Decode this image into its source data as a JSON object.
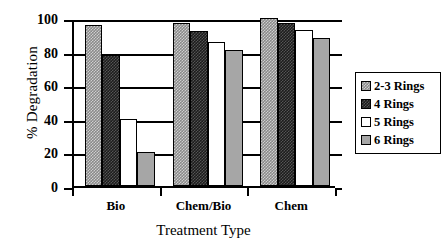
{
  "chart_data": {
    "type": "bar",
    "title": "",
    "xlabel": "Treatment Type",
    "ylabel": "% Degradation",
    "categories": [
      "Bio",
      "Chem/Bio",
      "Chem"
    ],
    "series": [
      {
        "name": "2-3 Rings",
        "values": [
          96,
          97,
          100
        ],
        "swatch": "checkered-light-gray"
      },
      {
        "name": "4 Rings",
        "values": [
          78,
          92,
          97
        ],
        "swatch": "dark-dither"
      },
      {
        "name": "5 Rings",
        "values": [
          40,
          86,
          93
        ],
        "swatch": "white"
      },
      {
        "name": "6 Rings",
        "values": [
          20,
          81,
          88
        ],
        "swatch": "medium-gray"
      }
    ],
    "ylim": [
      0,
      100
    ],
    "yticks": [
      0,
      20,
      40,
      60,
      80,
      100
    ],
    "ytick_labels": [
      "0",
      "20",
      "40",
      "60",
      "80",
      "100"
    ],
    "grid": true,
    "legend_position": "right"
  },
  "colors": {
    "axis": "#000000",
    "series_2_3_rings": "#8a8a8a",
    "series_4_rings": "#1c1c1c",
    "series_5_rings": "#ffffff",
    "series_6_rings": "#a6a6a6"
  }
}
